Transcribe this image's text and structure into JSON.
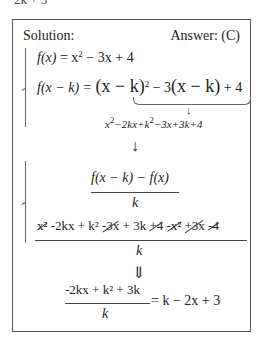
{
  "cutoff_text": "2k + 3",
  "header": {
    "solution_label": "Solution:",
    "answer_label": "Answer: (C)"
  },
  "system1": {
    "eq1": {
      "lhs": "f(x)",
      "rhs_a": "= x",
      "rhs_exp": "2",
      "rhs_b": " − 3x + 4"
    },
    "eq2": {
      "lhs": "f(x − k) = ",
      "p1": "(x − k)",
      "p1_exp": "2",
      "p2": " − 3",
      "p3": "(x − k)",
      "p4": " + 4"
    },
    "expansion_arrow": "↓",
    "expansion": {
      "a": "x",
      "a_exp": "2",
      "b": "−2kx+k",
      "b_exp": "2",
      "c": "−3x+3k+4"
    }
  },
  "arrow1": "↓",
  "system2": {
    "frac_num": "f(x − k) − f(x)",
    "frac_den": "k",
    "long_terms": [
      {
        "text": "x²",
        "struck": true
      },
      {
        "text": " -2kx + k² ",
        "struck": false
      },
      {
        "text": "-3x",
        "struck": true
      },
      {
        "text": " + 3k ",
        "struck": false
      },
      {
        "text": "+4",
        "struck": true
      },
      {
        "text": " ",
        "struck": false
      },
      {
        "text": "-x²",
        "struck": true
      },
      {
        "text": " ",
        "struck": false
      },
      {
        "text": "+3x",
        "struck": true
      },
      {
        "text": " ",
        "struck": false
      },
      {
        "text": "-4",
        "struck": true
      }
    ],
    "long_den": "k"
  },
  "arrow2": "⇓",
  "result": {
    "num": "-2kx + k² + 3k",
    "den": "k",
    "rhs": "= k − 2x + 3"
  }
}
